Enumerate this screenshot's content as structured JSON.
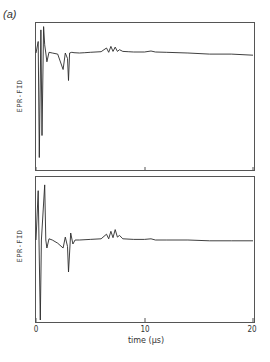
{
  "figure": {
    "panel_label": "(a)",
    "panel_label_letter": "a"
  },
  "chart_data": [
    {
      "type": "line",
      "title": "",
      "panel": "top",
      "xlabel": "",
      "ylabel": "EPR-FID",
      "xlim": [
        0,
        20
      ],
      "x_unit": "μs",
      "grid": false,
      "series": [
        {
          "name": "EPR-FID (top)",
          "x": [
            0.0,
            0.2,
            0.3,
            0.45,
            0.55,
            0.7,
            0.8,
            0.9,
            1.0,
            1.2,
            1.5,
            2.0,
            2.5,
            2.7,
            2.9,
            3.0,
            3.1,
            3.3,
            3.5,
            4.0,
            4.5,
            5.0,
            6.0,
            6.5,
            6.7,
            6.9,
            7.1,
            7.3,
            7.5,
            7.7,
            8.0,
            8.5,
            9.0,
            10.0,
            10.6,
            11.0,
            12.0,
            14.0,
            16.0,
            18.0,
            20.0
          ],
          "y": [
            0.0,
            0.35,
            -0.95,
            0.7,
            -0.75,
            0.8,
            0.25,
            0.0,
            -0.08,
            0.02,
            0.0,
            -0.01,
            -0.15,
            0.0,
            -0.05,
            -0.25,
            0.0,
            0.02,
            0.01,
            0.0,
            0.01,
            0.02,
            0.04,
            0.15,
            0.02,
            0.2,
            0.05,
            0.18,
            0.05,
            0.1,
            0.05,
            0.04,
            0.03,
            0.03,
            0.06,
            0.03,
            0.02,
            0.0,
            -0.01,
            -0.01,
            -0.02
          ]
        }
      ]
    },
    {
      "type": "line",
      "title": "",
      "panel": "bottom",
      "xlabel": "time (μs)",
      "ylabel": "EPR-FID",
      "xlim": [
        0,
        20
      ],
      "x_unit": "μs",
      "xticks": [
        0,
        10,
        20
      ],
      "xtick_labels": [
        "0",
        "10",
        "20"
      ],
      "grid": false,
      "series": [
        {
          "name": "EPR-FID (bottom)",
          "x": [
            0.0,
            0.2,
            0.4,
            0.5,
            0.8,
            0.9,
            1.0,
            1.2,
            1.5,
            2.0,
            2.5,
            2.7,
            2.9,
            3.0,
            3.2,
            3.4,
            3.6,
            4.0,
            5.0,
            6.0,
            6.5,
            6.7,
            6.9,
            7.1,
            7.3,
            7.5,
            7.7,
            8.0,
            9.0,
            10.0,
            10.6,
            11.0,
            12.0,
            14.0,
            16.0,
            18.0,
            20.0
          ],
          "y": [
            0.0,
            0.85,
            -1.0,
            0.0,
            0.95,
            0.0,
            -0.1,
            0.02,
            0.0,
            -0.04,
            -0.1,
            0.05,
            -0.08,
            -0.4,
            0.12,
            -0.05,
            0.0,
            0.0,
            0.01,
            0.02,
            0.1,
            0.02,
            0.15,
            0.04,
            0.18,
            0.05,
            0.08,
            0.02,
            0.01,
            0.01,
            0.02,
            0.0,
            0.0,
            0.0,
            -0.01,
            -0.01,
            -0.01
          ]
        }
      ]
    }
  ],
  "axes": {
    "ylabel_top": "EPR-FID",
    "ylabel_bottom": "EPR-FID",
    "xlabel": "time (μs)",
    "xtick_labels": [
      "0",
      "10",
      "20"
    ]
  },
  "colors": {
    "line": "#2a2a2a",
    "frame": "#555555",
    "background": "#ffffff"
  }
}
